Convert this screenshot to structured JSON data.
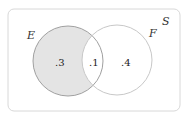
{
  "diagram": {
    "type": "venn",
    "universe_label": "S",
    "sets": [
      {
        "name": "E",
        "shaded": true
      },
      {
        "name": "F",
        "shaded": false
      }
    ],
    "regions": {
      "E_only": ".3",
      "E_and_F": ".1",
      "F_only": ".4"
    },
    "colors": {
      "border": "#d8d8d8",
      "shade": "#e6e6e6",
      "circle_e": "#9a9a9a",
      "circle_f": "#c8c8c8"
    }
  }
}
